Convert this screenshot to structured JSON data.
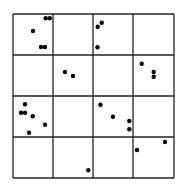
{
  "diagram": {
    "type": "grid-dot-plot",
    "rows": 4,
    "cols": 4,
    "line_color": "#222222",
    "dot_color": "#000000",
    "x_lines": [
      13,
      53,
      93,
      133,
      174
    ],
    "y_lines": [
      14,
      55,
      96,
      137,
      178
    ],
    "dot_radius": 2.2,
    "dots": [
      {
        "x": 45.7,
        "y": 18.3
      },
      {
        "x": 49.7,
        "y": 18.3
      },
      {
        "x": 33.0,
        "y": 31.0
      },
      {
        "x": 41.0,
        "y": 47.0
      },
      {
        "x": 45.0,
        "y": 47.0
      },
      {
        "x": 101.7,
        "y": 22.7
      },
      {
        "x": 97.7,
        "y": 26.7
      },
      {
        "x": 97.5,
        "y": 47.3
      },
      {
        "x": 65.0,
        "y": 72.0
      },
      {
        "x": 73.0,
        "y": 76.0
      },
      {
        "x": 141.7,
        "y": 63.7
      },
      {
        "x": 153.7,
        "y": 72.0
      },
      {
        "x": 153.7,
        "y": 76.7
      },
      {
        "x": 25.0,
        "y": 104.3
      },
      {
        "x": 21.0,
        "y": 112.7
      },
      {
        "x": 25.0,
        "y": 112.7
      },
      {
        "x": 32.7,
        "y": 116.3
      },
      {
        "x": 45.0,
        "y": 124.7
      },
      {
        "x": 29.0,
        "y": 132.7
      },
      {
        "x": 100.5,
        "y": 104.7
      },
      {
        "x": 113.0,
        "y": 116.7
      },
      {
        "x": 129.3,
        "y": 121.0
      },
      {
        "x": 129.3,
        "y": 129.3
      },
      {
        "x": 165.0,
        "y": 142.0
      },
      {
        "x": 137.0,
        "y": 150.0
      },
      {
        "x": 88.3,
        "y": 170.2
      }
    ]
  }
}
